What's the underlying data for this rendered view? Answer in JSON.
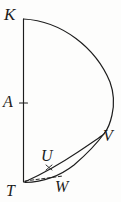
{
  "figure": {
    "background_color": "#fdfdfc",
    "ink_color": "#1d1d1d",
    "width": 121,
    "height": 202,
    "labels": {
      "K": "K",
      "A": "A",
      "T": "T",
      "U": "U",
      "V": "V",
      "W": "W"
    },
    "points": {
      "K": {
        "x": 23,
        "y": 19
      },
      "A": {
        "x": 24,
        "y": 103
      },
      "T": {
        "x": 24,
        "y": 182
      },
      "U": {
        "x": 49,
        "y": 167
      },
      "V": {
        "x": 104,
        "y": 133
      },
      "W": {
        "x": 62,
        "y": 178
      }
    },
    "elements": [
      {
        "name": "vertical-axis-KT",
        "kind": "line",
        "style": "solid",
        "from": "K",
        "to": "T"
      },
      {
        "name": "major-arc-KV",
        "kind": "arc",
        "style": "solid",
        "from": "K",
        "to": "V"
      },
      {
        "name": "lower-arc-VT",
        "kind": "arc",
        "style": "solid",
        "from": "V",
        "to": "T"
      },
      {
        "name": "chord-TV",
        "kind": "line",
        "style": "solid",
        "from": "T",
        "to": "V"
      },
      {
        "name": "dashed-segment-TW",
        "kind": "line",
        "style": "dashed",
        "from": "T",
        "to": "W"
      },
      {
        "name": "tick-mark-A",
        "kind": "tick",
        "at": "A"
      },
      {
        "name": "cross-mark-U",
        "kind": "cross",
        "at": "U"
      }
    ]
  }
}
